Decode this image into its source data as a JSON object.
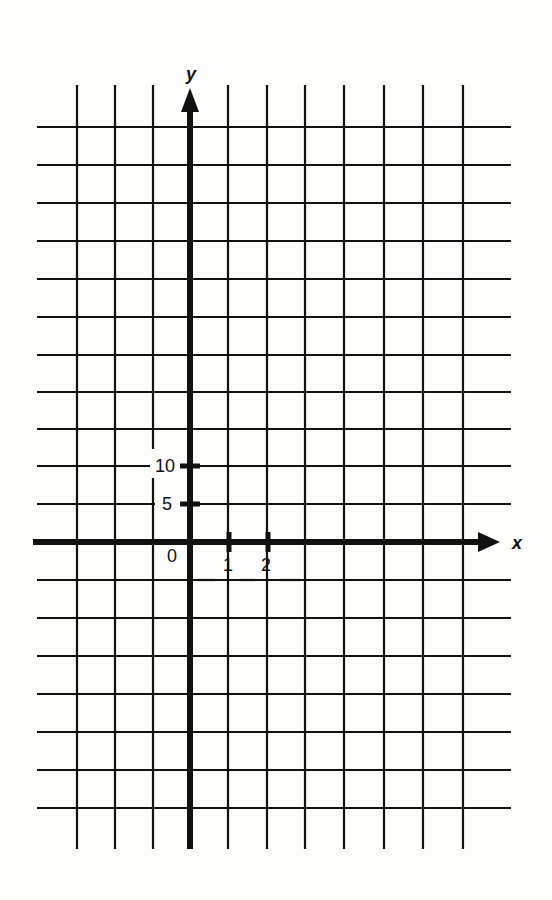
{
  "diagram": {
    "type": "coordinate-grid",
    "x_axis_label": "x",
    "y_axis_label": "y",
    "origin_label": "0",
    "x_tick_labels": [
      "1",
      "2"
    ],
    "y_tick_labels": [
      "5",
      "10"
    ],
    "colors": {
      "background": "#fdfdfb",
      "lines": "#111111"
    }
  }
}
